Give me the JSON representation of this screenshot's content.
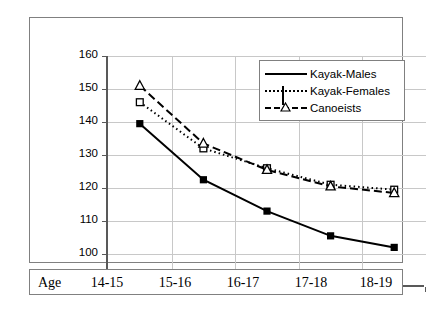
{
  "chart_data": {
    "type": "line",
    "title": "",
    "xlabel": "Age",
    "ylabel": "Performance time on 500-m,s",
    "categories": [
      "14-15",
      "15-16",
      "16-17",
      "17-18",
      "18-19"
    ],
    "ylim": [
      90,
      160
    ],
    "yticks": [
      90,
      100,
      110,
      120,
      130,
      140,
      150,
      160
    ],
    "grid": true,
    "legend_position": "top-right",
    "series": [
      {
        "name": "Kayak-Males",
        "marker": "filled-square",
        "line_style": "solid",
        "values": [
          139.5,
          122.5,
          113.0,
          105.5,
          102.0
        ]
      },
      {
        "name": "Kayak-Females",
        "marker": "open-square",
        "line_style": "dotted",
        "values": [
          146.0,
          132.0,
          126.0,
          121.0,
          119.5
        ]
      },
      {
        "name": "Canoeists",
        "marker": "open-triangle",
        "line_style": "dashed",
        "values": [
          151.0,
          133.5,
          125.5,
          120.5,
          118.5
        ]
      }
    ]
  },
  "axis": {
    "y_label": "Performance time on 500-m,s",
    "y_tick_labels": [
      "160",
      "150",
      "140",
      "130",
      "120",
      "110",
      "100",
      "90"
    ],
    "x_row_label": "Age",
    "x_tick_labels": [
      "14-15",
      "15-16",
      "16-17",
      "17-18",
      "18-19"
    ]
  },
  "legend": {
    "items": [
      {
        "label": "Kayak-Males"
      },
      {
        "label": "Kayak-Females"
      },
      {
        "label": "Canoeists"
      }
    ]
  },
  "colors": {
    "line": "#000000",
    "grid": "#c8c8c8",
    "axis": "#595959",
    "frame": "#808080",
    "background": "#ffffff"
  }
}
